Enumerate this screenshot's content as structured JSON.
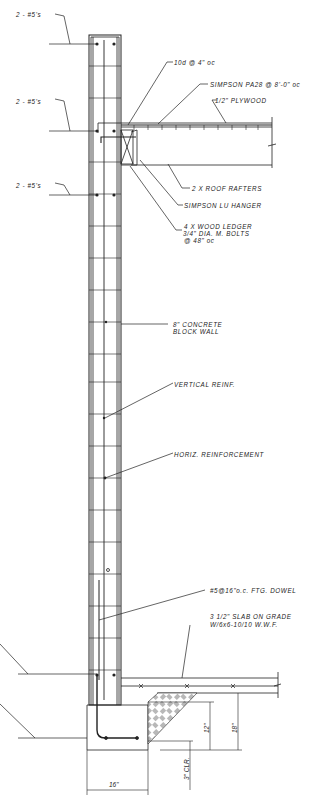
{
  "drawing": {
    "title": "Concrete Block Wall Section with Roof Ledger and Footing",
    "line_color": "#222222",
    "background": "#ffffff"
  },
  "labels": {
    "rebar_top": "2 - #5's",
    "rebar_bond_beam": "2 - #5's",
    "rebar_lower_beam": "2 - #5's",
    "nailing": "10d @ 4\" oc",
    "strap": "SIMPSON PA28 @ 8'-0\" oc",
    "plywood": "1/2\" PLYWOOD",
    "rafters": "2 X ROOF RAFTERS",
    "hanger": "SIMPSON LU HANGER",
    "ledger_line1": "4 X WOOD LEDGER",
    "ledger_line2": "3/4\" DIA. M. BOLTS",
    "ledger_line3": "@ 48\" oc",
    "wall_line1": "8\" CONCRETE",
    "wall_line2": "BLOCK WALL",
    "vertical_reinf": "VERTICAL REINF.",
    "horiz_reinf": "HORIZ. REINFORCEMENT",
    "dowel": "#5@16\"o.c. FTG. DOWEL",
    "slab_line1": "3 1/2\" SLAB ON GRADE",
    "slab_line2": "W/6x6-10/10 W.W.F."
  },
  "dimensions": {
    "footing_depth": "12\"",
    "footing_total": "18\"",
    "clearance": "3\" CLR.",
    "footing_width": "16\""
  }
}
